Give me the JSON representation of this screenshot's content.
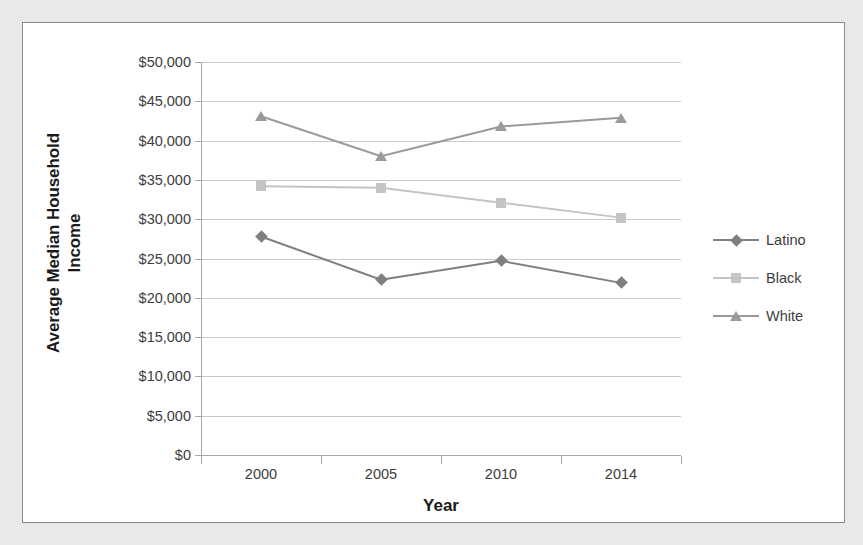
{
  "chart_data": {
    "type": "line",
    "title": "",
    "xlabel": "Year",
    "ylabel": "Average Median Household Income",
    "ylabel_line1": "Average Median Household",
    "ylabel_line2": "Income",
    "categories": [
      "2000",
      "2005",
      "2010",
      "2014"
    ],
    "ylim": [
      0,
      50000
    ],
    "ytick_step": 5000,
    "ytick_labels": [
      "$50,000",
      "$45,000",
      "$40,000",
      "$35,000",
      "$30,000",
      "$25,000",
      "$20,000",
      "$15,000",
      "$10,000",
      "$5,000",
      "$0"
    ],
    "ytick_values": [
      50000,
      45000,
      40000,
      35000,
      30000,
      25000,
      20000,
      15000,
      10000,
      5000,
      0
    ],
    "grid": true,
    "legend_position": "right",
    "series": [
      {
        "name": "Latino",
        "marker": "diamond",
        "color": "#7f7f7f",
        "values": [
          27800,
          22300,
          24700,
          21900
        ]
      },
      {
        "name": "Black",
        "marker": "square",
        "color": "#c4c4c4",
        "values": [
          34200,
          34000,
          32100,
          30200
        ]
      },
      {
        "name": "White",
        "marker": "triangle",
        "color": "#9a9a9a",
        "values": [
          43100,
          38000,
          41800,
          42900
        ]
      }
    ]
  },
  "colors": {
    "page_background": "#e9e9e7",
    "panel_background": "#ffffff",
    "panel_border": "#8a8a8a",
    "gridline": "#c9c9c9",
    "axis_line": "#a6a6a6",
    "tick_text": "#3d3d3d",
    "title_text": "#1a1a1a"
  }
}
